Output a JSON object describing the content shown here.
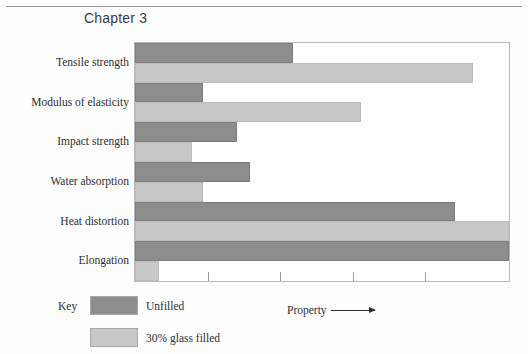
{
  "page": {
    "chapter_title": "Chapter 3"
  },
  "legend": {
    "key_label": "Key",
    "entries": [
      {
        "label": "Unfilled",
        "color": "#8d8d8d"
      },
      {
        "label": "30% glass filled",
        "color": "#c8c8c8"
      }
    ]
  },
  "chart_data": {
    "type": "bar",
    "orientation": "horizontal",
    "title": "Chapter 3",
    "xlabel": "Property",
    "ylabel": "",
    "grid": false,
    "legend_position": "bottom-left",
    "axis_arrow": true,
    "xlim": [
      0,
      5.15
    ],
    "xticks": [
      1,
      2,
      3,
      4
    ],
    "xtick_labels": [
      "",
      "",
      "",
      ""
    ],
    "categories": [
      "Tensile strength",
      "Modulus of elasticity",
      "Impact strength",
      "Water absorption",
      "Heat distortion",
      "Elongation"
    ],
    "series": [
      {
        "name": "Unfilled",
        "color": "#8d8d8d",
        "values": [
          2.17,
          0.93,
          1.41,
          1.58,
          4.4,
          5.15
        ]
      },
      {
        "name": "30% glass filled",
        "color": "#c8c8c8",
        "values": [
          4.66,
          3.11,
          0.78,
          0.93,
          5.15,
          0.33
        ]
      }
    ]
  }
}
